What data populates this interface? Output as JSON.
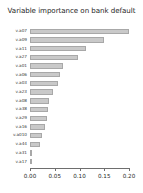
{
  "chart_data": {
    "type": "bar",
    "orientation": "horizontal",
    "title": "Variable importance on bank default",
    "xlabel": "",
    "ylabel": "",
    "xlim": [
      0.0,
      0.2
    ],
    "grid": false,
    "legend": null,
    "bar_color": "#c9c9c9",
    "bar_border_color": "#a8a8a8",
    "xticks": [
      "0.00",
      "0.05",
      "0.10",
      "0.15",
      "0.20"
    ],
    "xtick_values": [
      0.0,
      0.05,
      0.1,
      0.15,
      0.2
    ],
    "categories": [
      "v.a07",
      "v.a09",
      "v.a11",
      "v.a27",
      "v.a01",
      "v.a06",
      "v.a03",
      "v.a23",
      "v.a08",
      "v.a38",
      "v.a29",
      "v.a16",
      "v.a010",
      "v.a44",
      "v.a31",
      "v.a17"
    ],
    "values": [
      0.199,
      0.149,
      0.113,
      0.096,
      0.066,
      0.06,
      0.057,
      0.047,
      0.039,
      0.036,
      0.034,
      0.031,
      0.024,
      0.021,
      0.003,
      0.001
    ]
  }
}
